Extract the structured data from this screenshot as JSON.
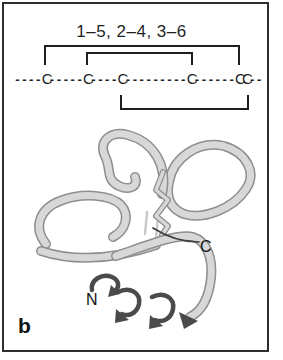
{
  "panel": {
    "label": "b"
  },
  "connectivity": {
    "title": "1–5, 2–4, 3–6",
    "sequence": "----C-----C----C---------C------CC--"
  },
  "structure": {
    "n_terminus_label": "N",
    "c_terminus_label": "C"
  },
  "colors": {
    "frame_border": "#2e2e2e",
    "diagram_line": "#1f1f1f",
    "text": "#111111",
    "ribbon_light": "#d8d8d8",
    "ribbon_outline": "#8e8e8e",
    "ribbon_dark": "#4a4a4a"
  }
}
